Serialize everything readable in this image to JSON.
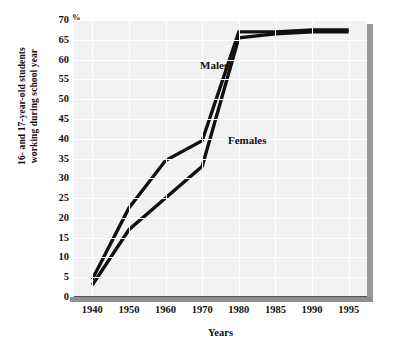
{
  "chart_data": {
    "type": "line",
    "title": "",
    "subtitle": "",
    "xlabel": "Years",
    "ylabel": "16- and 17-year-old students working during school year",
    "ylabel_line1": "16- and 17-year-old students",
    "ylabel_line2": "working during school year",
    "unit_symbol": "%",
    "x": [
      1940,
      1950,
      1960,
      1970,
      1980,
      1985,
      1990,
      1995
    ],
    "xtick_labels": [
      "1940",
      "1950",
      "1960",
      "1970",
      "1980",
      "1985",
      "1990",
      "1995"
    ],
    "ytick_labels": [
      "0",
      "5",
      "10",
      "15",
      "20",
      "25",
      "30",
      "35",
      "40",
      "45",
      "50",
      "55",
      "60",
      "65",
      "70"
    ],
    "ytick_values": [
      0,
      5,
      10,
      15,
      20,
      25,
      30,
      35,
      40,
      45,
      50,
      55,
      60,
      65,
      70
    ],
    "ylim": [
      0,
      70
    ],
    "grid": true,
    "grid_color": "#ffffff",
    "plot_background": "#f2f2f2",
    "line_color": "#111111",
    "legend_position": "inline-annotations",
    "series": [
      {
        "name": "Males",
        "values": [
          4.5,
          22.5,
          34.5,
          39.5,
          67,
          67,
          67.5,
          67.5
        ]
      },
      {
        "name": "Females",
        "values": [
          3,
          17,
          25,
          33,
          65.5,
          66.5,
          67,
          67
        ]
      }
    ],
    "annotations": [
      {
        "text": "Males",
        "series": "Males"
      },
      {
        "text": "Females",
        "series": "Females"
      }
    ]
  }
}
